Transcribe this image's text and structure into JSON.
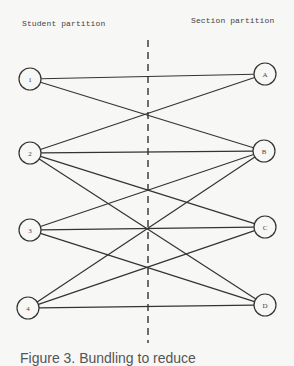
{
  "headers": {
    "left": "Student partition",
    "right": "Section partition"
  },
  "left_nodes": [
    {
      "id": "1",
      "label": "1",
      "x": 30,
      "y": 79
    },
    {
      "id": "2",
      "label": "2",
      "x": 30,
      "y": 153
    },
    {
      "id": "3",
      "label": "3",
      "x": 30,
      "y": 230
    },
    {
      "id": "4",
      "label": "4",
      "x": 28,
      "y": 308
    }
  ],
  "right_nodes": [
    {
      "id": "A",
      "label": "A",
      "x": 265,
      "y": 74
    },
    {
      "id": "B",
      "label": "B",
      "x": 264,
      "y": 151
    },
    {
      "id": "C",
      "label": "C",
      "x": 265,
      "y": 227
    },
    {
      "id": "D",
      "label": "D",
      "x": 265,
      "y": 305
    }
  ],
  "edges": [
    [
      "1",
      "A"
    ],
    [
      "1",
      "B"
    ],
    [
      "2",
      "A"
    ],
    [
      "2",
      "B"
    ],
    [
      "2",
      "C"
    ],
    [
      "2",
      "D"
    ],
    [
      "3",
      "B"
    ],
    [
      "3",
      "C"
    ],
    [
      "3",
      "D"
    ],
    [
      "4",
      "B"
    ],
    [
      "4",
      "C"
    ],
    [
      "4",
      "D"
    ]
  ],
  "divider": {
    "x": 148,
    "y1": 40,
    "y2": 343,
    "style": "dashed"
  },
  "caption": "Figure 3. Bundling to reduce"
}
